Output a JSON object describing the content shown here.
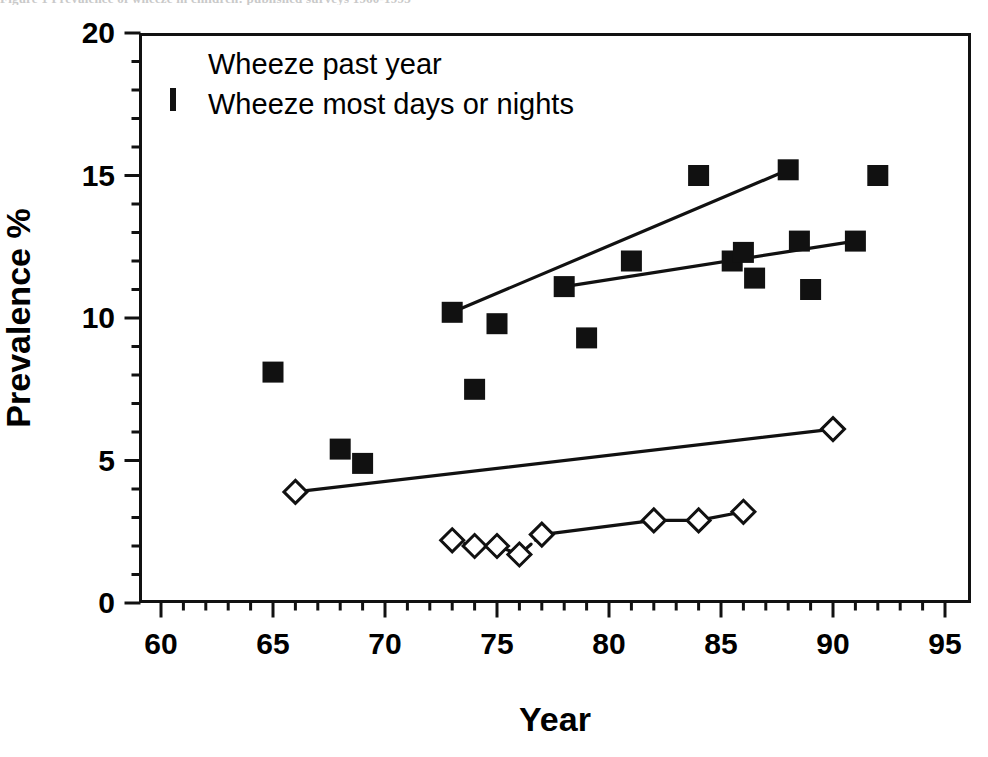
{
  "caption_sliver": "Figure 1  Prevalence of wheeze in children: published surveys 1960-1995",
  "legend": {
    "items": [
      {
        "label": "Wheeze past year",
        "marker": "filled-square",
        "color": "#111111"
      },
      {
        "label": "Wheeze most days or nights",
        "marker": "open-diamond",
        "color": "#111111"
      }
    ]
  },
  "axes": {
    "x": {
      "title": "Year",
      "min": 60,
      "max": 95,
      "major_ticks": [
        60,
        65,
        70,
        75,
        80,
        85,
        90,
        95
      ],
      "major_tick_labels": [
        "60",
        "65",
        "70",
        "75",
        "80",
        "85",
        "90",
        "95"
      ],
      "minor_tick_step": 1
    },
    "y": {
      "title": "Prevalence %",
      "min": 0,
      "max": 20,
      "major_ticks": [
        0,
        5,
        10,
        15,
        20
      ],
      "major_tick_labels": [
        "0",
        "5",
        "10",
        "15",
        "20"
      ],
      "minor_tick_step": 1
    }
  },
  "chart_data": {
    "type": "scatter",
    "title": "",
    "xlabel": "Year",
    "ylabel": "Prevalence %",
    "xlim": [
      60,
      95
    ],
    "ylim": [
      0,
      20
    ],
    "grid": false,
    "legend_position": "top-left",
    "series": [
      {
        "name": "Wheeze past year",
        "marker": "filled-square",
        "color": "#111111",
        "points": [
          {
            "x": 65.0,
            "y": 8.1
          },
          {
            "x": 68.0,
            "y": 5.4
          },
          {
            "x": 69.0,
            "y": 4.9
          },
          {
            "x": 73.0,
            "y": 10.2
          },
          {
            "x": 74.0,
            "y": 7.5
          },
          {
            "x": 75.0,
            "y": 9.8
          },
          {
            "x": 78.0,
            "y": 11.1
          },
          {
            "x": 79.0,
            "y": 9.3
          },
          {
            "x": 81.0,
            "y": 12.0
          },
          {
            "x": 84.0,
            "y": 15.0
          },
          {
            "x": 85.5,
            "y": 12.0
          },
          {
            "x": 86.0,
            "y": 12.3
          },
          {
            "x": 86.5,
            "y": 11.4
          },
          {
            "x": 88.0,
            "y": 15.2
          },
          {
            "x": 88.5,
            "y": 12.7
          },
          {
            "x": 89.0,
            "y": 11.0
          },
          {
            "x": 91.0,
            "y": 12.7
          },
          {
            "x": 92.0,
            "y": 15.0
          }
        ]
      },
      {
        "name": "Wheeze most days or nights",
        "marker": "open-diamond",
        "color": "#111111",
        "points": [
          {
            "x": 66.0,
            "y": 3.9
          },
          {
            "x": 73.0,
            "y": 2.2
          },
          {
            "x": 74.0,
            "y": 2.0
          },
          {
            "x": 75.0,
            "y": 2.0
          },
          {
            "x": 76.0,
            "y": 1.7
          },
          {
            "x": 77.0,
            "y": 2.4
          },
          {
            "x": 82.0,
            "y": 2.9
          },
          {
            "x": 84.0,
            "y": 2.9
          },
          {
            "x": 86.0,
            "y": 3.2
          },
          {
            "x": 90.0,
            "y": 6.1
          }
        ]
      }
    ],
    "trend_lines": [
      {
        "name": "wheeze-past-year-steep-trend",
        "series": "Wheeze past year",
        "from": {
          "x": 73.0,
          "y": 10.2
        },
        "to": {
          "x": 88.0,
          "y": 15.2
        }
      },
      {
        "name": "wheeze-past-year-shallow-trend",
        "series": "Wheeze past year",
        "from": {
          "x": 78.0,
          "y": 11.1
        },
        "to": {
          "x": 91.0,
          "y": 12.7
        }
      },
      {
        "name": "wheeze-most-days-long-trend",
        "series": "Wheeze most days or nights",
        "from": {
          "x": 66.0,
          "y": 3.9
        },
        "to": {
          "x": 90.0,
          "y": 6.1
        }
      },
      {
        "name": "wheeze-most-days-connector",
        "series": "Wheeze most days or nights",
        "from": {
          "x": 77.0,
          "y": 2.4
        },
        "to": {
          "x": 86.0,
          "y": 3.2
        },
        "waypoints": [
          {
            "x": 82.0,
            "y": 2.9
          },
          {
            "x": 84.0,
            "y": 2.9
          }
        ]
      },
      {
        "name": "wheeze-most-days-dashed-connector",
        "series": "Wheeze most days or nights",
        "dashed": true,
        "from": {
          "x": 73.0,
          "y": 2.2
        },
        "to": {
          "x": 77.0,
          "y": 2.4
        },
        "waypoints": [
          {
            "x": 74.0,
            "y": 2.0
          },
          {
            "x": 75.0,
            "y": 2.0
          },
          {
            "x": 76.0,
            "y": 1.7
          }
        ]
      }
    ]
  }
}
